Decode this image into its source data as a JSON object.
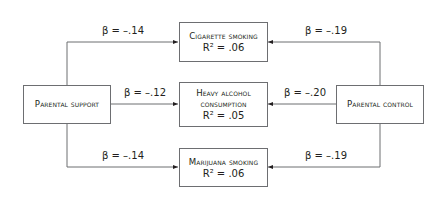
{
  "diagram": {
    "type": "path-model",
    "predictors": [
      {
        "id": "support",
        "label": "Parental support"
      },
      {
        "id": "control",
        "label": "Parental control"
      }
    ],
    "outcomes": [
      {
        "id": "cig",
        "line1": "Cigarette smoking",
        "r2": "R² = .06"
      },
      {
        "id": "alc",
        "line1": "Heavy alcohol",
        "line2": "consumption",
        "r2": "R² = .05"
      },
      {
        "id": "mar",
        "line1": "Marijuana smoking",
        "r2": "R² = .06"
      }
    ],
    "paths": [
      {
        "from": "support",
        "to": "cig",
        "label": "β = –.14"
      },
      {
        "from": "support",
        "to": "alc",
        "label": "β = –.12"
      },
      {
        "from": "support",
        "to": "mar",
        "label": "β = –.14"
      },
      {
        "from": "control",
        "to": "cig",
        "label": "β = –.19"
      },
      {
        "from": "control",
        "to": "alc",
        "label": "β = –.20"
      },
      {
        "from": "control",
        "to": "mar",
        "label": "β = –.19"
      }
    ],
    "colors": {
      "line": "#6d6e71",
      "text": "#231f20",
      "background": "#ffffff"
    }
  }
}
